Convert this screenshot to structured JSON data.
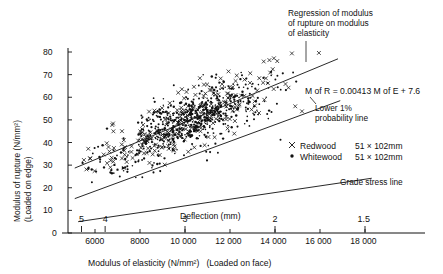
{
  "chart_data": {
    "type": "scatter",
    "title": "",
    "xlabel": "Modulus of elasticity (N/mm²)   (Loaded on face)",
    "ylabel": "Modulus of rupture (N/mm²)\n(Loaded on edge)",
    "ylabel_line1": "Modulus of rupture (N/mm²)",
    "ylabel_line2": "(Loaded on edge)",
    "xlim": [
      5000,
      18500
    ],
    "ylim": [
      0,
      80
    ],
    "grid": false,
    "legend_position": "right-middle",
    "x_ticks": [
      6000,
      8000,
      10000,
      12000,
      14000,
      16000,
      18000
    ],
    "x_tick_labels": [
      "6000",
      "8000",
      "10 000",
      "12 000",
      "14 000",
      "16 000",
      "18 000"
    ],
    "y_ticks": [
      0,
      10,
      20,
      30,
      40,
      50,
      60,
      70,
      80
    ],
    "y_tick_labels": [
      "0",
      "10",
      "20",
      "30",
      "40",
      "50",
      "60",
      "70",
      "80"
    ],
    "secondary_axis": {
      "label": "Deflection (mm)",
      "ticks": [
        5,
        4,
        3,
        2,
        1.5
      ],
      "tick_labels": [
        "5",
        "4",
        "3",
        "2",
        "1.5"
      ],
      "tick_x_values": [
        5400,
        6450,
        10000,
        14000,
        18000
      ]
    },
    "legend": [
      {
        "marker": "x",
        "name": "Redwood",
        "size": "51 × 102mm"
      },
      {
        "marker": "dot",
        "name": "Whitewood",
        "size": "51 × 102mm"
      }
    ],
    "annotations": [
      {
        "id": "regression",
        "text": "Regression of modulus\nof rupture on modulus\nof elasticity",
        "line1": "Regression of modulus",
        "line2": "of rupture on modulus",
        "line3": "of elasticity"
      },
      {
        "id": "equation",
        "text": "M of R = 0.00413 M of E + 7.6"
      },
      {
        "id": "lower1pct",
        "text": "Lower 1%\nprobability line",
        "line1": "Lower 1%",
        "line2": "probability line"
      },
      {
        "id": "grade-stress",
        "text": "Grade stress line"
      }
    ],
    "series": [
      {
        "name": "Regression line",
        "type": "line",
        "slope": 0.00413,
        "intercept": 7.6,
        "x": [
          5100,
          16800
        ],
        "y": [
          28.7,
          77.0
        ]
      },
      {
        "name": "Lower 1% probability line",
        "type": "line",
        "x": [
          5100,
          16900
        ],
        "y": [
          15.2,
          58.5
        ]
      },
      {
        "name": "Grade stress line",
        "type": "line",
        "x": [
          5250,
          18300
        ],
        "y": [
          5.0,
          24.2
        ]
      }
    ]
  }
}
